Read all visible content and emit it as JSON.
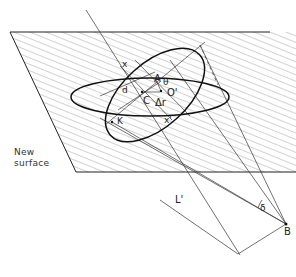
{
  "figure": {
    "surface_label_line1": "New",
    "surface_label_line2": "surface",
    "labels": {
      "x": "x",
      "x_prime": "x'",
      "A": "A",
      "theta": "θ",
      "O_prime": "O'",
      "C": "C",
      "delta_r": "Δr",
      "d": "d",
      "K": "K",
      "delta": "δ",
      "L_prime": "L'",
      "B": "B"
    },
    "colors": {
      "line": "#222222",
      "hatch": "#555555",
      "background": "#ffffff"
    }
  }
}
